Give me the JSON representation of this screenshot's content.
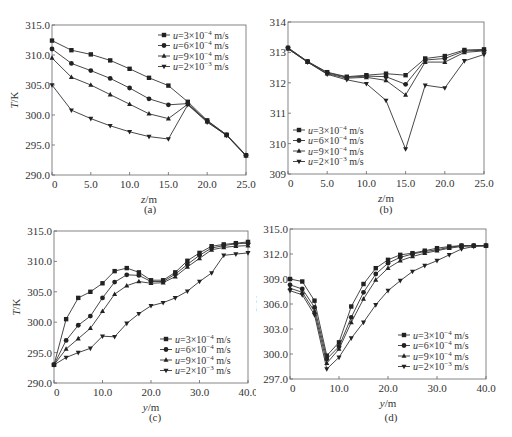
{
  "legend_labels": [
    "u=3×10⁻⁴ m/s",
    "u=6×10⁻⁴ m/s",
    "u=9×10⁻⁴ m/s",
    "u=2×10⁻³ m/s"
  ],
  "chart_data": [
    {
      "id": "a",
      "type": "line",
      "caption": "(a)",
      "xlabel": "z/m",
      "ylabel": "T/K",
      "xlim": [
        0,
        25
      ],
      "ylim": [
        290,
        315
      ],
      "xticks": [
        0,
        5,
        10,
        15,
        20,
        25
      ],
      "xtick_labels": [
        "0",
        "5.0",
        "10.0",
        "15.0",
        "20.0",
        "25.0"
      ],
      "yticks": [
        290,
        295,
        300,
        305,
        310,
        315
      ],
      "ytick_labels": [
        "290.0",
        "295.0",
        "300.0",
        "305.0",
        "310.0",
        "315.0"
      ],
      "legend_position": "upper right",
      "x": [
        0,
        2.5,
        5,
        7.5,
        10,
        12.5,
        15,
        17.5,
        20,
        22.5,
        25
      ],
      "series": [
        {
          "name": "u=3×10⁻⁴ m/s",
          "marker": "square",
          "values": [
            312.4,
            310.8,
            310.1,
            309.1,
            307.7,
            306.2,
            304.9,
            302.2,
            299.1,
            296.7,
            293.3
          ]
        },
        {
          "name": "u=6×10⁻⁴ m/s",
          "marker": "circle",
          "values": [
            311.0,
            308.6,
            307.4,
            306.1,
            304.5,
            302.7,
            301.7,
            301.9,
            299.0,
            296.7,
            293.3
          ]
        },
        {
          "name": "u=9×10⁻⁴ m/s",
          "marker": "triangle-up",
          "values": [
            309.5,
            306.3,
            305.0,
            303.4,
            301.8,
            300.2,
            299.4,
            301.8,
            298.9,
            296.6,
            293.2
          ]
        },
        {
          "name": "u=2×10⁻³ m/s",
          "marker": "triangle-down",
          "values": [
            305.0,
            300.8,
            299.4,
            298.2,
            297.2,
            296.4,
            296.0,
            301.7,
            298.8,
            296.6,
            293.2
          ]
        }
      ]
    },
    {
      "id": "b",
      "type": "line",
      "caption": "(b)",
      "xlabel": "z/m",
      "ylabel": "T/K",
      "xlim": [
        0,
        25
      ],
      "ylim": [
        309,
        314
      ],
      "xticks": [
        0,
        5,
        10,
        15,
        20,
        25
      ],
      "xtick_labels": [
        "0",
        "5.0",
        "10.0",
        "15.0",
        "20.0",
        "25.0"
      ],
      "yticks": [
        309,
        310,
        311,
        312,
        313,
        314
      ],
      "ytick_labels": [
        "309",
        "310",
        "311",
        "312",
        "313",
        "314"
      ],
      "legend_position": "lower left",
      "x": [
        0,
        2.5,
        5,
        7.5,
        10,
        12.5,
        15,
        17.5,
        20,
        22.5,
        25
      ],
      "series": [
        {
          "name": "u=3×10⁻⁴ m/s",
          "marker": "square",
          "values": [
            313.15,
            312.7,
            312.35,
            312.2,
            312.25,
            312.3,
            312.25,
            312.8,
            312.88,
            313.08,
            313.1
          ]
        },
        {
          "name": "u=6×10⁻⁴ m/s",
          "marker": "circle",
          "values": [
            313.15,
            312.7,
            312.33,
            312.18,
            312.22,
            312.2,
            311.95,
            312.75,
            312.8,
            313.05,
            313.07
          ]
        },
        {
          "name": "u=9×10⁻⁴ m/s",
          "marker": "triangle-up",
          "values": [
            313.12,
            312.68,
            312.3,
            312.15,
            312.18,
            312.08,
            311.6,
            312.68,
            312.68,
            313.0,
            313.05
          ]
        },
        {
          "name": "u=2×10⁻³ m/s",
          "marker": "triangle-down",
          "values": [
            313.12,
            312.68,
            312.28,
            312.1,
            311.97,
            311.42,
            309.82,
            311.92,
            311.83,
            312.72,
            312.93
          ]
        }
      ]
    },
    {
      "id": "c",
      "type": "line",
      "caption": "(c)",
      "xlabel": "y/m",
      "ylabel": "T/K",
      "xlim": [
        0,
        40
      ],
      "ylim": [
        290,
        315
      ],
      "xticks": [
        0,
        10,
        20,
        30,
        40
      ],
      "xtick_labels": [
        "0",
        "10.0",
        "20.0",
        "30.0",
        "40.0"
      ],
      "yticks": [
        290,
        295,
        300,
        305,
        310,
        315
      ],
      "ytick_labels": [
        "290.0",
        "295.0",
        "300.0",
        "305.0",
        "310.0",
        "315.0"
      ],
      "legend_position": "lower right",
      "x": [
        0,
        2.5,
        5,
        7.5,
        10,
        12.5,
        15,
        17.5,
        20,
        22.5,
        25,
        27.5,
        30,
        32.5,
        35,
        37.5,
        40
      ],
      "series": [
        {
          "name": "u=3×10⁻⁴ m/s",
          "marker": "square",
          "values": [
            293.0,
            300.5,
            304.0,
            305.0,
            306.4,
            308.4,
            308.9,
            308.2,
            306.9,
            306.9,
            308.2,
            310.1,
            311.4,
            312.5,
            312.8,
            313.0,
            313.2
          ]
        },
        {
          "name": "u=6×10⁻⁴ m/s",
          "marker": "circle",
          "values": [
            293.0,
            297.0,
            299.5,
            301.0,
            304.0,
            306.6,
            307.8,
            307.7,
            306.7,
            306.7,
            307.9,
            309.5,
            311.0,
            312.2,
            312.6,
            312.9,
            313.0
          ]
        },
        {
          "name": "u=9×10⁻⁴ m/s",
          "marker": "triangle-up",
          "values": [
            293.0,
            295.6,
            297.3,
            299.0,
            301.8,
            304.6,
            306.0,
            306.7,
            306.4,
            306.5,
            307.5,
            309.1,
            310.5,
            311.9,
            312.3,
            312.5,
            312.6
          ]
        },
        {
          "name": "u=2×10⁻³ m/s",
          "marker": "triangle-down",
          "values": [
            293.0,
            294.2,
            295.0,
            295.7,
            297.7,
            297.6,
            299.8,
            301.4,
            302.7,
            303.2,
            304.0,
            305.1,
            306.7,
            308.1,
            311.0,
            311.2,
            311.4
          ]
        }
      ]
    },
    {
      "id": "d",
      "type": "line",
      "caption": "(d)",
      "xlabel": "y/m",
      "ylabel": "T/K",
      "xlim": [
        0,
        40
      ],
      "ylim": [
        297,
        315
      ],
      "xticks": [
        0,
        10,
        20,
        30,
        40
      ],
      "xtick_labels": [
        "0",
        "10.0",
        "20.0",
        "30.0",
        "40.0"
      ],
      "yticks": [
        297,
        300,
        303,
        306,
        309,
        312,
        315
      ],
      "ytick_labels": [
        "297.0",
        "300.0",
        "303.0",
        "306.0",
        "309.0",
        "312.0",
        "315.0"
      ],
      "legend_position": "lower right",
      "x": [
        0,
        2.5,
        5,
        7.5,
        10,
        12.5,
        15,
        17.5,
        20,
        22.5,
        25,
        27.5,
        30,
        32.5,
        35,
        37.5,
        40
      ],
      "series": [
        {
          "name": "u=3×10⁻⁴ m/s",
          "marker": "square",
          "values": [
            309.0,
            308.7,
            306.4,
            299.8,
            301.4,
            305.7,
            308.4,
            310.3,
            311.3,
            311.9,
            312.1,
            312.4,
            312.7,
            312.9,
            313.0,
            313.0,
            313.0
          ]
        },
        {
          "name": "u=6×10⁻⁴ m/s",
          "marker": "circle",
          "values": [
            308.3,
            307.8,
            305.6,
            299.4,
            300.9,
            304.4,
            307.4,
            309.6,
            310.9,
            311.6,
            312.0,
            312.3,
            312.5,
            312.8,
            313.0,
            313.0,
            313.0
          ]
        },
        {
          "name": "u=9×10⁻⁴ m/s",
          "marker": "triangle-up",
          "values": [
            307.9,
            307.4,
            305.1,
            298.9,
            300.6,
            303.8,
            306.6,
            308.9,
            310.3,
            311.2,
            311.7,
            312.1,
            312.4,
            312.7,
            312.9,
            313.0,
            313.0
          ]
        },
        {
          "name": "u=2×10⁻³ m/s",
          "marker": "triangle-down",
          "values": [
            307.6,
            307.1,
            304.7,
            298.2,
            299.6,
            301.9,
            303.8,
            305.9,
            307.6,
            308.8,
            309.9,
            310.6,
            311.2,
            311.9,
            312.6,
            312.9,
            313.0
          ]
        }
      ]
    }
  ]
}
